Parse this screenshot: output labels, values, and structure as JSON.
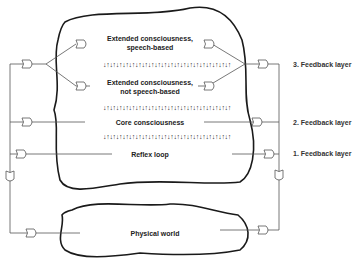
{
  "diagram": {
    "regions": {
      "mind": {
        "levels": [
          {
            "id": "ext-speech",
            "line1": "Extended consciousness,",
            "line2": "speech-based"
          },
          {
            "id": "ext-nonspeech",
            "line1": "Extended consciousness,",
            "line2": "not speech-based"
          },
          {
            "id": "core",
            "line1": "Core consciousness"
          },
          {
            "id": "reflex",
            "line1": "Reflex loop"
          }
        ]
      },
      "world": {
        "label": "Physical world"
      }
    },
    "feedback_layers": [
      {
        "label": "3. Feedback layer"
      },
      {
        "label": "2. Feedback layer"
      },
      {
        "label": "1. Feedback layer"
      }
    ],
    "arrow_strip": "↓↑↓↑↓↑↓↑↓↑↓↑↓↑↓↑↓↑↓↑↓↑↓↑↓↑↓↑↓↑↓↑↓↑↓↑↓↑↓↑",
    "colors": {
      "outline": "#1a1a1a",
      "wire": "#555555",
      "text": "#222222"
    }
  }
}
